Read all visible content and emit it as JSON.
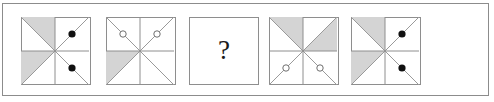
{
  "frame": {
    "border_color": "#8c8c8c",
    "background": "#ffffff"
  },
  "style": {
    "shade_color": "#d4d4d4",
    "line_color": "#8e8e8e",
    "diagonal_color": "#9a9a9a",
    "dot_fill": "#111111",
    "circle_stroke": "#6f6f6f",
    "circle_fill": "#ffffff",
    "question_color": "#1a1a1a"
  },
  "puzzle": {
    "type": "visual-analogy-matrix",
    "question_symbol": "?",
    "panels": [
      {
        "id": "panel-1",
        "index": 1,
        "kind": "figure",
        "x": 18,
        "shaded_triangles": [
          "top-left-upper-right",
          "bottom-left-upper-left"
        ],
        "marks": {
          "style": "filled-dot",
          "count": 2,
          "positions": [
            "top-right",
            "bottom-right"
          ]
        }
      },
      {
        "id": "panel-2",
        "index": 2,
        "kind": "figure",
        "x": 103,
        "shaded_triangles": [
          "bottom-left-upper-left",
          "bottom-right-lower-right"
        ],
        "marks": {
          "style": "open-circle",
          "count": 2,
          "positions": [
            "top-left",
            "top-right"
          ]
        }
      },
      {
        "id": "panel-3",
        "index": 3,
        "kind": "question",
        "x": 186,
        "shaded_triangles": [],
        "marks": {
          "style": "none",
          "count": 0,
          "positions": []
        }
      },
      {
        "id": "panel-4",
        "index": 4,
        "kind": "figure",
        "x": 266,
        "shaded_triangles": [
          "top-left-upper-right",
          "top-right-lower-right"
        ],
        "marks": {
          "style": "open-circle",
          "count": 2,
          "positions": [
            "bottom-left",
            "bottom-right"
          ]
        }
      },
      {
        "id": "panel-5",
        "index": 5,
        "kind": "figure",
        "x": 348,
        "shaded_triangles": [
          "top-left-upper-right",
          "bottom-left-upper-left"
        ],
        "marks": {
          "style": "filled-dot",
          "count": 2,
          "positions": [
            "top-right",
            "bottom-right"
          ]
        }
      }
    ]
  }
}
